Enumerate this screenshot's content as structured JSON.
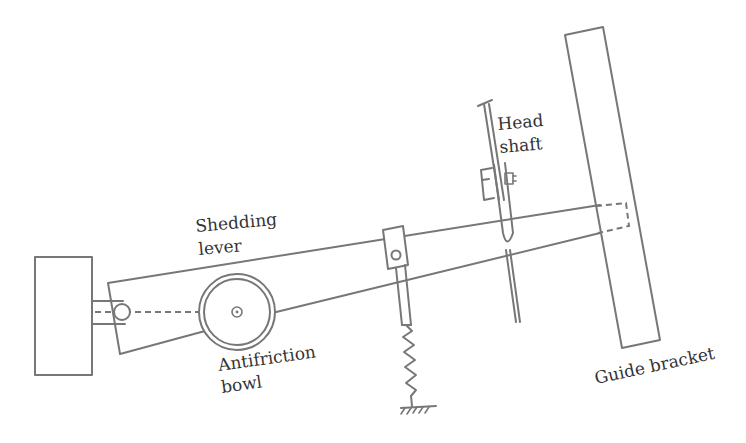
{
  "diagram": {
    "type": "mechanism schematic",
    "labels": {
      "shedding_lever_line1": "Shedding",
      "shedding_lever_line2": "lever",
      "head_shaft_line1": "Head",
      "head_shaft_line2": "shaft",
      "antifriction_bowl_line1": "Antifriction",
      "antifriction_bowl_line2": "bowl",
      "guide_bracket": "Guide bracket"
    },
    "components": [
      "fulcrum-block",
      "pivot-pin",
      "shedding-lever",
      "antifriction-bowl",
      "spring-link",
      "return-spring",
      "ground-anchor",
      "head-shaft",
      "guide-bracket"
    ],
    "colors": {
      "stroke": "#777777",
      "text": "#333333",
      "background": "#ffffff"
    }
  }
}
